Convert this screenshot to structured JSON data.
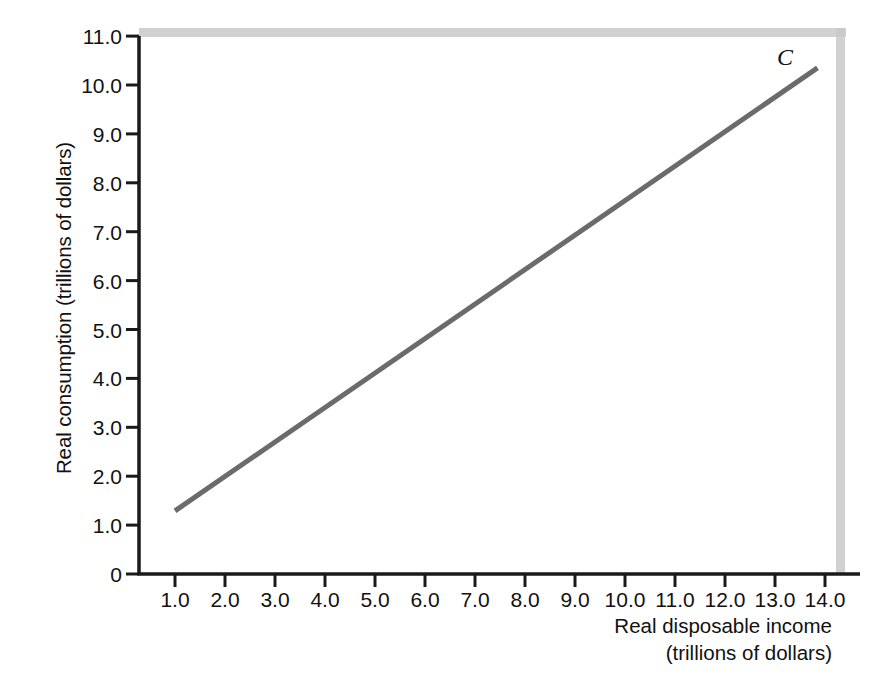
{
  "chart_data": {
    "type": "line",
    "title": "",
    "xlabel": "Real disposable income (trillions of dollars)",
    "ylabel": "Real consumption (trillions of dollars)",
    "xlabel_line1": "Real disposable income",
    "xlabel_line2": "(trillions of dollars)",
    "xlim": [
      0,
      14.6
    ],
    "ylim": [
      0,
      11.0
    ],
    "grid": false,
    "legend": "none",
    "x_tick_labels": [
      "1.0",
      "2.0",
      "3.0",
      "4.0",
      "5.0",
      "6.0",
      "7.0",
      "8.0",
      "9.0",
      "10.0",
      "11.0",
      "12.0",
      "13.0",
      "14.0"
    ],
    "x_ticks": [
      1,
      2,
      3,
      4,
      5,
      6,
      7,
      8,
      9,
      10,
      11,
      12,
      13,
      14
    ],
    "y_tick_labels": [
      "0",
      "1.0",
      "2.0",
      "3.0",
      "4.0",
      "5.0",
      "6.0",
      "7.0",
      "8.0",
      "9.0",
      "10.0",
      "11.0"
    ],
    "y_ticks": [
      0,
      1,
      2,
      3,
      4,
      5,
      6,
      7,
      8,
      9,
      10,
      11
    ],
    "series": [
      {
        "name": "C",
        "annotation": "C",
        "color": "#6b6b6b",
        "line_width": 5,
        "x": [
          1.0,
          13.85
        ],
        "y": [
          1.29,
          10.35
        ]
      }
    ],
    "annotations": [
      {
        "text": "C",
        "x": 13.3,
        "y": 10.8,
        "style": "italic-serif"
      }
    ],
    "colors": {
      "line": "#6b6b6b",
      "axis": "#1a1a1a",
      "frame_shadow": "#c9c9c9",
      "background": "#ffffff",
      "text": "#111111"
    }
  }
}
